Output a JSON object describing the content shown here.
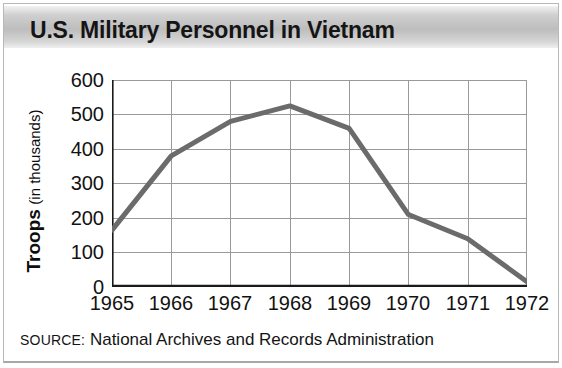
{
  "title": "U.S. Military Personnel in Vietnam",
  "source_prefix": "SOURCE:",
  "source_text": " National Archives and Records Administration",
  "axis": {
    "ylabel_strong": "Troops",
    "ylabel_light": "(in thousands)",
    "yticks": [
      "600",
      "500",
      "400",
      "300",
      "200",
      "100",
      "0"
    ],
    "xticks": [
      "1965",
      "1966",
      "1967",
      "1968",
      "1969",
      "1970",
      "1971",
      "1972"
    ]
  },
  "colors": {
    "line": "#6b6b6b",
    "grid": "#9a9a9a",
    "axis": "#1a1a1a",
    "title_band_start": "#f2f2f2",
    "title_band_end": "#bdbdbd",
    "background": "#ffffff",
    "text": "#121212"
  },
  "chart_data": {
    "type": "line",
    "title": "U.S. Military Personnel in Vietnam",
    "xlabel": "",
    "ylabel": "Troops (in thousands)",
    "categories": [
      "1965",
      "1966",
      "1967",
      "1968",
      "1969",
      "1970",
      "1971",
      "1972"
    ],
    "x": [
      1965,
      1966,
      1967,
      1968,
      1969,
      1970,
      1971,
      1972
    ],
    "values": [
      165,
      380,
      480,
      525,
      460,
      210,
      140,
      15
    ],
    "series": [
      {
        "name": "U.S. military personnel in Vietnam (thousands)",
        "values": [
          165,
          380,
          480,
          525,
          460,
          210,
          140,
          15
        ]
      }
    ],
    "ylim": [
      0,
      600
    ],
    "yticks": [
      0,
      100,
      200,
      300,
      400,
      500,
      600
    ],
    "xlim": [
      1965,
      1972
    ],
    "grid": true,
    "legend": false,
    "units": "thousands of troops",
    "annotations": [
      "SOURCE: National Archives and Records Administration"
    ]
  }
}
